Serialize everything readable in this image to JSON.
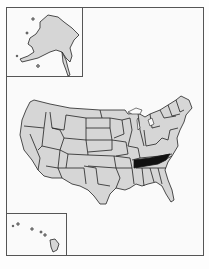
{
  "map": {
    "title": "United States locator map",
    "highlighted_state": "Tennessee",
    "colors": {
      "state_fill": "#d6d6d6",
      "highlight_fill": "#111111",
      "border": "#222222",
      "background": "#fafafa"
    },
    "insets": [
      {
        "label": "Alaska"
      },
      {
        "label": "Hawaii"
      }
    ]
  }
}
